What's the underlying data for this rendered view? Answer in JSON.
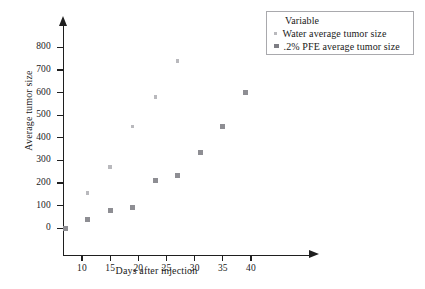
{
  "chart_data": {
    "type": "scatter",
    "title": "",
    "xlabel": "Days after injection",
    "ylabel": "Average tumor size",
    "xlim": [
      5,
      44
    ],
    "ylim": [
      -40,
      850
    ],
    "xticks": [
      10,
      15,
      20,
      25,
      30,
      35,
      40
    ],
    "yticks": [
      0,
      100,
      200,
      300,
      400,
      500,
      600,
      700,
      800
    ],
    "grid": false,
    "legend_position": "top-right",
    "legend_title": "Variable",
    "series": [
      {
        "name": "Water average tumor size",
        "marker": "small-dot",
        "color": "#b9b9bd",
        "points": [
          {
            "x": 11,
            "y": 155
          },
          {
            "x": 15,
            "y": 270
          },
          {
            "x": 19,
            "y": 450
          },
          {
            "x": 23,
            "y": 580
          },
          {
            "x": 27,
            "y": 740
          }
        ]
      },
      {
        "name": ".2% PFE average tumor size",
        "marker": "square",
        "color": "#8e8e93",
        "points": [
          {
            "x": 7,
            "y": 0
          },
          {
            "x": 11,
            "y": 40
          },
          {
            "x": 15,
            "y": 78
          },
          {
            "x": 19,
            "y": 92
          },
          {
            "x": 23,
            "y": 212
          },
          {
            "x": 27,
            "y": 232
          },
          {
            "x": 31,
            "y": 333
          },
          {
            "x": 35,
            "y": 450
          },
          {
            "x": 39,
            "y": 600
          }
        ]
      }
    ]
  },
  "legend": {
    "title": "Variable",
    "entries": [
      {
        "label": "Water average tumor size"
      },
      {
        "label": ".2% PFE average tumor size"
      }
    ]
  },
  "axes": {
    "x_title": "Days after injection",
    "y_title": "Average tumor size",
    "x_tick_labels": [
      "10",
      "15",
      "20",
      "25",
      "30",
      "35",
      "40"
    ],
    "y_tick_labels": [
      "0",
      "100",
      "200",
      "300",
      "400",
      "500",
      "600",
      "700",
      "800"
    ]
  },
  "colors": {
    "axis": "#1f1f1f",
    "water_marker": "#b9b9bd",
    "pfe_marker": "#8e8e93",
    "legend_border": "#a9a9ad",
    "background": "#ffffff"
  }
}
